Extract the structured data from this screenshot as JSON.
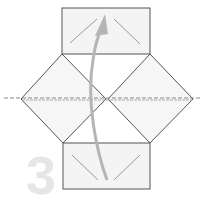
{
  "diagram": {
    "step_number": "3",
    "colors": {
      "paper": "#f4f4f4",
      "outline": "#555555",
      "arrow": "#b5b5b5",
      "crease": "#a0a0a0",
      "step_number": "#e6e6e6"
    },
    "elements": [
      {
        "name": "top-flap",
        "type": "rectangle"
      },
      {
        "name": "left-diamond",
        "type": "square-rotated"
      },
      {
        "name": "right-diamond",
        "type": "square-rotated"
      },
      {
        "name": "bottom-flap",
        "type": "rectangle"
      },
      {
        "name": "center-fold-line",
        "type": "dashed-line"
      },
      {
        "name": "fold-arrow",
        "type": "curved-arrow",
        "direction": "up"
      }
    ]
  }
}
